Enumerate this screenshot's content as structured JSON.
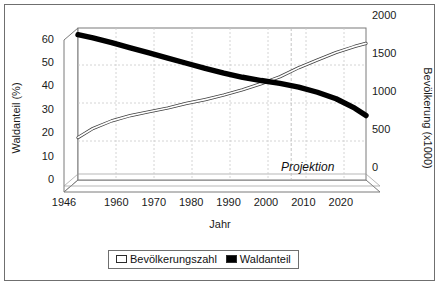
{
  "chart_data": {
    "type": "line",
    "title": "",
    "xlabel": "Jahr",
    "ylabel": "Waldanteil (%)",
    "ylabel_right": "Bevölkerung (x1000)",
    "xlim": [
      1946,
      2023
    ],
    "ylim": [
      0,
      65
    ],
    "ylim_right": [
      0,
      2000
    ],
    "xticks": [
      1946,
      1960,
      1970,
      1980,
      1990,
      2000,
      2010,
      2020
    ],
    "xticklabels": [
      "1946",
      "1960",
      "1970",
      "1980",
      "1990",
      "2000",
      "2010",
      "2020"
    ],
    "yticks_left": [
      0,
      10,
      20,
      30,
      40,
      50,
      60
    ],
    "yticklabels_left": [
      "0",
      "10",
      "20",
      "30",
      "40",
      "50",
      "60"
    ],
    "yticks_right": [
      0,
      500,
      1000,
      1500,
      2000
    ],
    "yticklabels_right": [
      "0",
      "500",
      "1000",
      "1500",
      "2000"
    ],
    "grid": true,
    "legend_position": "bottom-center",
    "style": "3d-perspective-walls",
    "annotations": [
      {
        "text": "Projektion",
        "x": 2004,
        "style": "italic"
      }
    ],
    "projection_start_year": 2003,
    "series": [
      {
        "name": "Bevölkerungszahl",
        "axis": "right",
        "marker": "open-square",
        "color": "#ffffff",
        "edge_color": "#4d4d4d",
        "x": [
          1946,
          1950,
          1955,
          1960,
          1965,
          1970,
          1975,
          1980,
          1985,
          1990,
          1995,
          2000,
          2005,
          2010,
          2015,
          2020,
          2023
        ],
        "values": [
          400,
          520,
          620,
          690,
          740,
          790,
          850,
          900,
          960,
          1030,
          1110,
          1200,
          1320,
          1420,
          1520,
          1600,
          1640
        ]
      },
      {
        "name": "Waldanteil",
        "axis": "left",
        "marker": "filled-square",
        "color": "#000000",
        "x": [
          1946,
          1950,
          1955,
          1960,
          1965,
          1970,
          1975,
          1980,
          1985,
          1990,
          1995,
          2000,
          2005,
          2010,
          2015,
          2020,
          2023
        ],
        "values": [
          57.0,
          55.6,
          53.6,
          51.4,
          49.2,
          47.0,
          44.8,
          42.6,
          40.6,
          38.8,
          37.4,
          36.2,
          34.6,
          32.4,
          29.6,
          25.6,
          22.4
        ]
      }
    ]
  },
  "legend": {
    "items": [
      {
        "label": "Bevölkerungszahl",
        "swatch": "open-square"
      },
      {
        "label": "Waldanteil",
        "swatch": "filled-square"
      }
    ]
  }
}
